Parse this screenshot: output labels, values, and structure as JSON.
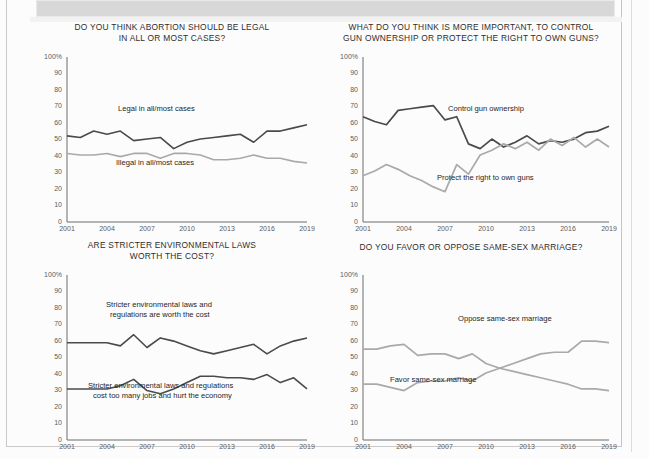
{
  "page": {
    "banner_label": "",
    "background_color": "#fcfcfc",
    "border_color": "#c9c9c9"
  },
  "axis": {
    "y_ticks": [
      "100%",
      "90",
      "80",
      "70",
      "60",
      "50",
      "40",
      "30",
      "20",
      "10",
      "0"
    ],
    "x_ticks": [
      "2001",
      "2004",
      "2007",
      "2010",
      "2013",
      "2016",
      "2019"
    ],
    "ylim": [
      0,
      100
    ],
    "xlim": [
      2001,
      2019
    ]
  },
  "colors": {
    "dark_line": "#4a4a4a",
    "light_line": "#a9a9a9",
    "axis": "#6d6d6d",
    "text": "#2e2e2e"
  },
  "chart_data": [
    {
      "id": "abortion",
      "type": "line",
      "title": "DO YOU THINK ABORTION SHOULD BE LEGAL IN ALL OR MOST CASES?",
      "title_lines": [
        "DO YOU THINK ABORTION SHOULD BE LEGAL",
        "IN ALL OR MOST CASES?"
      ],
      "xlabel": "",
      "ylabel": "",
      "ylim": [
        0,
        100
      ],
      "xlim": [
        2001,
        2019
      ],
      "grid": false,
      "legend_position": "inline-annotations",
      "x": [
        2001,
        2002,
        2003,
        2004,
        2005,
        2006,
        2007,
        2008,
        2009,
        2010,
        2011,
        2012,
        2013,
        2014,
        2015,
        2016,
        2017,
        2018,
        2019
      ],
      "series": [
        {
          "name": "Legal in all/most cases",
          "color": "#4a4a4a",
          "values": [
            54,
            53,
            57,
            55,
            57,
            51,
            52,
            53,
            46,
            50,
            52,
            53,
            54,
            55,
            50,
            57,
            57,
            59,
            61
          ]
        },
        {
          "name": "Illegal in all/most cases",
          "color": "#a9a9a9",
          "values": [
            43,
            42,
            42,
            43,
            41,
            43,
            43,
            40,
            43,
            43,
            42,
            39,
            39,
            40,
            42,
            40,
            40,
            38,
            37
          ]
        }
      ]
    },
    {
      "id": "guns",
      "type": "line",
      "title": "WHAT DO YOU THINK IS MORE IMPORTANT, TO CONTROL GUN OWNERSHIP OR PROTECT THE RIGHT TO OWN GUNS?",
      "title_lines": [
        "WHAT DO YOU THINK IS MORE IMPORTANT, TO CONTROL",
        "GUN OWNERSHIP OR PROTECT THE RIGHT TO OWN GUNS?"
      ],
      "xlabel": "",
      "ylabel": "",
      "ylim": [
        0,
        100
      ],
      "xlim": [
        2001,
        2019
      ],
      "grid": false,
      "legend_position": "inline-annotations",
      "x": [
        2001,
        2002,
        2003,
        2004,
        2005,
        2006,
        2007,
        2008,
        2009,
        2010,
        2011,
        2012,
        2013,
        2014,
        2015,
        2016,
        2017,
        2018,
        2019
      ],
      "series": [
        {
          "name": "Control gun ownership",
          "color": "#4a4a4a",
          "values": [
            66,
            63,
            61,
            70,
            71,
            72,
            73,
            64,
            66,
            49,
            46,
            52,
            47,
            50,
            54,
            49,
            51,
            50,
            52,
            56,
            57,
            60
          ]
        },
        {
          "name": "Protect the right to own guns",
          "color": "#a9a9a9",
          "values": [
            29,
            32,
            36,
            33,
            29,
            26,
            22,
            19,
            36,
            30,
            42,
            45,
            49,
            46,
            50,
            45,
            52,
            48,
            53,
            47,
            52,
            47
          ]
        }
      ]
    },
    {
      "id": "environment",
      "type": "line",
      "title": "ARE STRICTER ENVIRONMENTAL LAWS WORTH THE COST?",
      "title_lines": [
        "ARE STRICTER ENVIRONMENTAL LAWS",
        "WORTH THE COST?"
      ],
      "xlabel": "",
      "ylabel": "",
      "ylim": [
        0,
        100
      ],
      "xlim": [
        2001,
        2019
      ],
      "grid": false,
      "legend_position": "inline-annotations",
      "x": [
        2001,
        2002,
        2003,
        2004,
        2005,
        2006,
        2007,
        2008,
        2009,
        2010,
        2011,
        2012,
        2013,
        2014,
        2015,
        2016,
        2017,
        2018,
        2019
      ],
      "series": [
        {
          "name": "Stricter environmental laws and regulations are worth the cost",
          "color": "#4a4a4a",
          "values": [
            61,
            61,
            61,
            61,
            59,
            66,
            58,
            64,
            62,
            59,
            56,
            54,
            56,
            58,
            60,
            54,
            59,
            62,
            64
          ]
        },
        {
          "name": "Stricter environmental laws and regulations cost too many jobs and hurt the economy",
          "color": "#4a4a4a",
          "values": [
            32,
            32,
            32,
            32,
            34,
            38,
            31,
            29,
            32,
            36,
            40,
            40,
            39,
            39,
            38,
            41,
            36,
            39,
            32
          ]
        }
      ]
    },
    {
      "id": "same-sex-marriage",
      "type": "line",
      "title": "DO YOU FAVOR OR OPPOSE SAME-SEX MARRIAGE?",
      "title_lines": [
        "DO YOU FAVOR OR OPPOSE SAME-SEX MARRIAGE?"
      ],
      "xlabel": "",
      "ylabel": "",
      "ylim": [
        0,
        100
      ],
      "xlim": [
        2001,
        2019
      ],
      "grid": false,
      "legend_position": "inline-annotations",
      "x": [
        2001,
        2002,
        2003,
        2004,
        2005,
        2006,
        2007,
        2008,
        2009,
        2010,
        2011,
        2012,
        2013,
        2014,
        2015,
        2016,
        2017,
        2018,
        2019
      ],
      "series": [
        {
          "name": "Oppose same-sex marriage",
          "color": "#a9a9a9",
          "values": [
            57,
            57,
            59,
            60,
            53,
            54,
            54,
            51,
            54,
            48,
            45,
            43,
            41,
            39,
            37,
            35,
            32,
            32,
            31
          ]
        },
        {
          "name": "Favor same-sex marriage",
          "color": "#a9a9a9",
          "values": [
            35,
            35,
            33,
            31,
            36,
            37,
            37,
            39,
            37,
            42,
            45,
            48,
            51,
            54,
            55,
            55,
            62,
            62,
            61
          ]
        }
      ]
    }
  ],
  "annotations": {
    "abortion": [
      {
        "text": "Legal in all/most cases",
        "x": 118,
        "y": 108
      },
      {
        "text": "Illegal in all/most cases",
        "x": 116,
        "y": 162
      }
    ],
    "guns": [
      {
        "text": "Control gun ownership",
        "x": 448,
        "y": 108
      },
      {
        "text": "Protect the right to own guns",
        "x": 437,
        "y": 177
      }
    ],
    "environment": [
      {
        "text": "Stricter environmental laws and",
        "x": 106,
        "y": 304
      },
      {
        "text": "regulations are worth the cost",
        "x": 110,
        "y": 314
      },
      {
        "text": "Stricter environmental laws and regulations",
        "x": 88,
        "y": 385
      },
      {
        "text": "cost too many jobs and hurt the economy",
        "x": 93,
        "y": 395
      }
    ],
    "same-sex-marriage": [
      {
        "text": "Oppose same-sex marriage",
        "x": 458,
        "y": 318
      },
      {
        "text": "Favor same-sex marriage",
        "x": 390,
        "y": 379
      }
    ]
  }
}
